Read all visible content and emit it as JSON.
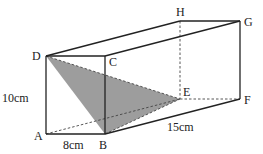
{
  "figure": {
    "type": "cuboid",
    "vertices": [
      "A",
      "B",
      "C",
      "D",
      "E",
      "F",
      "G",
      "H"
    ],
    "labels": {
      "A": "A",
      "B": "B",
      "C": "C",
      "D": "D",
      "E": "E",
      "F": "F",
      "G": "G",
      "H": "H"
    },
    "dimensions": {
      "height": "10cm",
      "width": "8cm",
      "length": "15cm"
    },
    "shaded_triangle": [
      "D",
      "B",
      "E"
    ],
    "shade_color": "#8c8c8c",
    "line_color": "#222222"
  }
}
